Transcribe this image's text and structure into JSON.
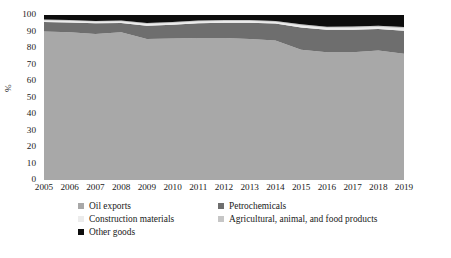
{
  "chart_data": {
    "type": "area",
    "stacked": true,
    "normalized": true,
    "title": "",
    "xlabel": "",
    "ylabel": "%",
    "ylim": [
      0,
      100
    ],
    "ytick_step": 10,
    "ytick_labels": [
      "100",
      "90",
      "80",
      "70",
      "60",
      "50",
      "40",
      "30",
      "20",
      "10",
      "0"
    ],
    "grid": false,
    "legend_position": "bottom",
    "categories": [
      "2005",
      "2006",
      "2007",
      "2008",
      "2009",
      "2010",
      "2011",
      "2012",
      "2013",
      "2014",
      "2015",
      "2016",
      "2017",
      "2018",
      "2019"
    ],
    "series": [
      {
        "name": "Oil exports",
        "color": "#a8a8a8",
        "values": [
          90.0,
          89.5,
          88.5,
          89.5,
          85.5,
          85.8,
          86.0,
          86.0,
          85.5,
          84.5,
          79.0,
          77.5,
          77.5,
          78.5,
          76.5
        ]
      },
      {
        "name": "Petrochemicals",
        "color": "#6e6e6e",
        "values": [
          5.8,
          6.0,
          6.5,
          5.7,
          8.0,
          8.3,
          9.0,
          9.3,
          9.8,
          10.3,
          13.5,
          13.5,
          13.5,
          13.0,
          14.0
        ]
      },
      {
        "name": "Construction materials",
        "color": "#ececec",
        "values": [
          0.9,
          0.9,
          0.9,
          0.9,
          1.0,
          1.0,
          1.0,
          1.0,
          1.0,
          1.0,
          1.2,
          1.2,
          1.3,
          1.3,
          1.4
        ]
      },
      {
        "name": "Agricultural, animal, and food products",
        "color": "#c6c6c6",
        "values": [
          0.5,
          0.5,
          0.5,
          0.5,
          0.6,
          0.6,
          0.6,
          0.6,
          0.6,
          0.6,
          0.7,
          0.7,
          0.7,
          0.7,
          0.8
        ]
      },
      {
        "name": "Other goods",
        "color": "#0d0d0d",
        "values": [
          2.8,
          3.1,
          3.6,
          3.4,
          4.9,
          4.3,
          3.4,
          3.1,
          3.1,
          3.6,
          5.6,
          7.1,
          7.0,
          6.5,
          7.3
        ]
      }
    ]
  },
  "axis": {
    "y_title": "%"
  },
  "legend": {
    "items": [
      {
        "label": "Oil exports",
        "color": "#a8a8a8"
      },
      {
        "label": "Petrochemicals",
        "color": "#6e6e6e"
      },
      {
        "label": "Construction materials",
        "color": "#ececec"
      },
      {
        "label": "Agricultural, animal, and food products",
        "color": "#c6c6c6"
      },
      {
        "label": "Other goods",
        "color": "#0d0d0d"
      }
    ]
  }
}
